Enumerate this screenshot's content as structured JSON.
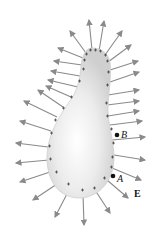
{
  "figure": {
    "labels": {
      "point_b": "B",
      "point_a": "A",
      "field": "E"
    },
    "colors": {
      "conductor_fill": "#d6d6d6",
      "conductor_highlight": "#ffffff",
      "field_line": "#8a8a8a",
      "charge_mark": "#333333",
      "point": "#111111"
    },
    "charge_symbol": "+"
  }
}
